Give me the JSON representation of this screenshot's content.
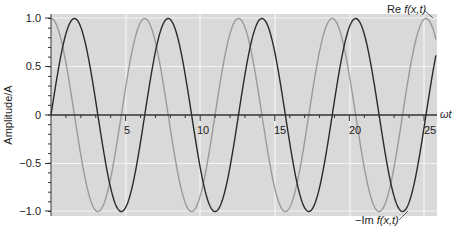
{
  "chart_data": {
    "type": "line",
    "title": "",
    "xlabel": "ωt",
    "ylabel": "Amplitude/A",
    "xlim": [
      0,
      25.8
    ],
    "ylim": [
      -1.05,
      1.05
    ],
    "x_ticks": [
      5,
      10,
      15,
      20,
      25
    ],
    "x_tick_labels": [
      "5",
      "10",
      "15",
      "20",
      "25"
    ],
    "y_ticks": [
      1.0,
      0.5,
      0,
      -0.5,
      -1.0
    ],
    "y_tick_labels": [
      "1.0",
      "0.5",
      "0",
      "-0.5",
      "-1.0"
    ],
    "grid": true,
    "series": [
      {
        "name": "Re f(x,t)",
        "function": "cos(ωt)",
        "color": "#9a9a9a",
        "x": [
          0,
          3.14,
          6.28,
          9.42,
          12.57,
          15.71,
          18.85,
          21.99,
          25.13
        ],
        "values": [
          1,
          -1,
          1,
          -1,
          1,
          -1,
          1,
          -1,
          1
        ]
      },
      {
        "name": "−Im f(x,t)",
        "function": "sin(ωt)",
        "color": "#2a2a2a",
        "x": [
          0,
          1.57,
          4.71,
          7.85,
          10.99,
          14.14,
          17.28,
          20.42,
          23.56
        ],
        "values": [
          0,
          1,
          -1,
          1,
          -1,
          1,
          -1,
          1,
          -1
        ]
      }
    ],
    "annotations": [
      {
        "text_prefix": "Re ",
        "text_italic": "f(x,t)",
        "points_to": "Re curve near x≈25.1, y≈1.0"
      },
      {
        "text_prefix": "−Im ",
        "text_italic": "f(x,t)",
        "points_to": "−Im curve near x≈23.6, y≈−1.0"
      }
    ],
    "legend": "none (inline annotations)"
  },
  "labels": {
    "ylabel": "Amplitude/A",
    "xlabel": "ωt",
    "re_prefix": "Re ",
    "re_italic": "f(x,t)",
    "im_prefix": "−Im ",
    "im_italic": "f(x,t)",
    "yticks": [
      "1.0",
      "0.5",
      "0",
      "−0.5",
      "−1.0"
    ],
    "xticks": [
      "5",
      "10",
      "15",
      "20",
      "25"
    ]
  },
  "colors": {
    "background": "#d9d9d9",
    "grid": "#f4f4f4",
    "re_curve": "#9a9a9a",
    "im_curve": "#2a2a2a",
    "axis": "#333333"
  }
}
